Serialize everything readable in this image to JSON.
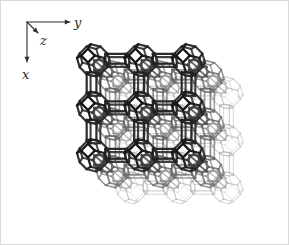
{
  "figure": {
    "name": "zeolite-lta-framework",
    "caption": "",
    "background_color": "#ffffff",
    "border_color": "#d9d9d9"
  },
  "axes": {
    "origin": [
      27,
      22
    ],
    "color": "#2b2b2b",
    "items": [
      {
        "id": "y",
        "label": "y",
        "direction": "right",
        "tip": [
          70,
          22
        ],
        "label_pos": [
          74,
          27
        ]
      },
      {
        "id": "x",
        "label": "x",
        "direction": "down",
        "tip": [
          27,
          62
        ],
        "label_pos": [
          22,
          79
        ]
      },
      {
        "id": "z",
        "label": "z",
        "direction": "down-right",
        "tip": [
          38,
          33
        ],
        "label_pos": [
          40,
          45
        ]
      }
    ]
  },
  "structure": {
    "type": "zeolite-framework",
    "framework_code": "LTA",
    "description": "cubic unit cell of the LTA zeolite framework: eight sodalite cages (truncated octahedra) at the cube corners linked through double four-rings, enclosing the central alpha cage",
    "projection": {
      "center": [
        160,
        124
      ],
      "scale": 47.5,
      "skew_x": 0.4,
      "skew_y": 0.34,
      "cell_repeats": 2
    },
    "rendering": {
      "front_color": "#161616",
      "mid_color": "#6e6e6e",
      "back_color": "#c2c2c2",
      "front_width": 2.3,
      "mid_width": 1.5,
      "back_width": 0.95
    },
    "cage": {
      "name": "sodalite-cage",
      "polyhedron": "truncated octahedron",
      "square_faces": 6,
      "hexagonal_faces": 8,
      "vertices": 24,
      "edges": 36,
      "radius": 0.29
    },
    "linker": {
      "name": "double-four-ring",
      "code": "D4R",
      "count_per_cell": 12
    }
  },
  "chart_data": {
    "type": "scatter",
    "title": "",
    "xlabel": "y",
    "ylabel": "x",
    "zlabel": "z",
    "note": "3D crystallographic wireframe; no numeric data series are plotted"
  }
}
